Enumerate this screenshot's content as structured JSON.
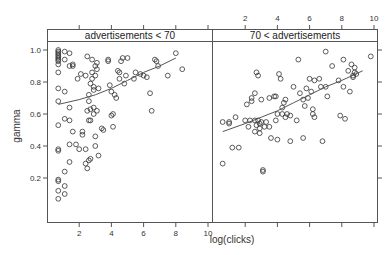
{
  "chart_data": [
    {
      "type": "scatter",
      "panel": "left",
      "strip_label": "advertisements < 70",
      "xlabel": "log(clicks)",
      "ylabel": "gamma",
      "xlim": [
        0,
        10
      ],
      "ylim": [
        0,
        1.05
      ],
      "x_ticks": [
        2,
        4,
        6,
        8,
        10
      ],
      "y_ticks": [
        0.2,
        0.4,
        0.6,
        0.8,
        1.0
      ],
      "trend_line": [
        [
          0.7,
          0.66
        ],
        [
          2,
          0.69
        ],
        [
          3,
          0.72
        ],
        [
          4,
          0.76
        ],
        [
          5,
          0.81
        ],
        [
          6,
          0.86
        ],
        [
          7,
          0.9
        ],
        [
          8,
          0.95
        ]
      ],
      "points": [
        [
          0.7,
          1.0
        ],
        [
          0.7,
          0.99
        ],
        [
          0.7,
          0.98
        ],
        [
          0.7,
          0.97
        ],
        [
          0.7,
          0.96
        ],
        [
          0.7,
          0.95
        ],
        [
          0.7,
          0.94
        ],
        [
          0.7,
          0.93
        ],
        [
          0.7,
          0.91
        ],
        [
          0.7,
          0.86
        ],
        [
          0.7,
          0.76
        ],
        [
          0.7,
          0.68
        ],
        [
          0.7,
          0.53
        ],
        [
          0.7,
          0.38
        ],
        [
          0.7,
          0.37
        ],
        [
          0.7,
          0.19
        ],
        [
          0.7,
          0.18
        ],
        [
          0.7,
          0.12
        ],
        [
          0.7,
          0.07
        ],
        [
          1.1,
          0.99
        ],
        [
          1.1,
          0.94
        ],
        [
          1.1,
          0.74
        ],
        [
          1.1,
          0.57
        ],
        [
          1.1,
          0.24
        ],
        [
          1.1,
          0.15
        ],
        [
          1.1,
          0.1
        ],
        [
          1.4,
          0.98
        ],
        [
          1.4,
          0.9
        ],
        [
          1.4,
          0.64
        ],
        [
          1.4,
          0.56
        ],
        [
          1.4,
          0.41
        ],
        [
          1.4,
          0.3
        ],
        [
          1.6,
          0.91
        ],
        [
          1.6,
          0.9
        ],
        [
          1.6,
          0.49
        ],
        [
          1.8,
          0.41
        ],
        [
          1.9,
          0.82
        ],
        [
          2.0,
          0.38
        ],
        [
          2.1,
          0.85
        ],
        [
          2.2,
          0.49
        ],
        [
          2.2,
          0.47
        ],
        [
          2.4,
          0.84
        ],
        [
          2.4,
          0.38
        ],
        [
          2.4,
          0.29
        ],
        [
          2.5,
          0.96
        ],
        [
          2.5,
          0.62
        ],
        [
          2.5,
          0.26
        ],
        [
          2.6,
          0.72
        ],
        [
          2.6,
          0.68
        ],
        [
          2.6,
          0.56
        ],
        [
          2.6,
          0.31
        ],
        [
          2.7,
          0.79
        ],
        [
          2.7,
          0.63
        ],
        [
          2.7,
          0.56
        ],
        [
          2.7,
          0.32
        ],
        [
          2.8,
          0.94
        ],
        [
          2.8,
          0.86
        ],
        [
          2.8,
          0.82
        ],
        [
          2.9,
          0.77
        ],
        [
          2.9,
          0.75
        ],
        [
          2.9,
          0.64
        ],
        [
          2.9,
          0.6
        ],
        [
          3.0,
          0.9
        ],
        [
          3.0,
          0.84
        ],
        [
          3.0,
          0.46
        ],
        [
          3.0,
          0.4
        ],
        [
          3.1,
          0.92
        ],
        [
          3.1,
          0.88
        ],
        [
          3.1,
          0.62
        ],
        [
          3.2,
          0.76
        ],
        [
          3.2,
          0.34
        ],
        [
          3.4,
          0.51
        ],
        [
          3.5,
          0.5
        ],
        [
          3.8,
          0.94
        ],
        [
          3.8,
          0.93
        ],
        [
          3.9,
          0.78
        ],
        [
          4.0,
          0.74
        ],
        [
          4.0,
          0.59
        ],
        [
          4.1,
          0.6
        ],
        [
          4.1,
          0.52
        ],
        [
          4.2,
          0.72
        ],
        [
          4.3,
          0.7
        ],
        [
          4.4,
          0.87
        ],
        [
          4.5,
          0.86
        ],
        [
          4.5,
          0.82
        ],
        [
          4.6,
          0.93
        ],
        [
          4.7,
          0.95
        ],
        [
          4.8,
          0.79
        ],
        [
          4.9,
          0.84
        ],
        [
          5.0,
          0.95
        ],
        [
          5.4,
          0.82
        ],
        [
          5.5,
          0.86
        ],
        [
          5.8,
          0.85
        ],
        [
          6.0,
          0.84
        ],
        [
          6.2,
          0.83
        ],
        [
          6.4,
          0.73
        ],
        [
          6.5,
          0.62
        ],
        [
          6.7,
          0.94
        ],
        [
          6.8,
          0.93
        ],
        [
          6.9,
          0.9
        ],
        [
          7.5,
          0.84
        ],
        [
          8.0,
          0.98
        ],
        [
          8.4,
          0.88
        ]
      ]
    },
    {
      "type": "scatter",
      "panel": "right",
      "strip_label": "70 < advertisements",
      "xlabel": "log(clicks)",
      "ylabel": "gamma",
      "xlim": [
        0,
        10
      ],
      "ylim": [
        0,
        1.05
      ],
      "x_ticks": [
        2,
        4,
        6,
        8,
        10
      ],
      "y_ticks": [
        0.2,
        0.4,
        0.6,
        0.8,
        1.0
      ],
      "trend_line": [
        [
          0.6,
          0.49
        ],
        [
          2,
          0.54
        ],
        [
          3,
          0.58
        ],
        [
          4,
          0.62
        ],
        [
          5,
          0.67
        ],
        [
          6,
          0.72
        ],
        [
          7,
          0.77
        ],
        [
          8,
          0.81
        ],
        [
          9.3,
          0.87
        ]
      ],
      "points": [
        [
          0.6,
          0.55
        ],
        [
          0.6,
          0.29
        ],
        [
          1.0,
          0.55
        ],
        [
          1.0,
          0.54
        ],
        [
          1.2,
          0.39
        ],
        [
          1.4,
          0.58
        ],
        [
          1.6,
          0.39
        ],
        [
          2.0,
          0.56
        ],
        [
          2.1,
          0.66
        ],
        [
          2.2,
          0.52
        ],
        [
          2.3,
          0.56
        ],
        [
          2.4,
          0.7
        ],
        [
          2.4,
          0.68
        ],
        [
          2.6,
          0.73
        ],
        [
          2.6,
          0.56
        ],
        [
          2.6,
          0.49
        ],
        [
          2.7,
          0.53
        ],
        [
          2.7,
          0.86
        ],
        [
          2.8,
          0.84
        ],
        [
          2.8,
          0.56
        ],
        [
          2.9,
          0.54
        ],
        [
          2.9,
          0.51
        ],
        [
          2.9,
          0.48
        ],
        [
          3.0,
          0.69
        ],
        [
          3.0,
          0.55
        ],
        [
          3.1,
          0.24
        ],
        [
          3.1,
          0.25
        ],
        [
          3.2,
          0.52
        ],
        [
          3.3,
          0.55
        ],
        [
          3.5,
          0.7
        ],
        [
          3.5,
          0.52
        ],
        [
          3.6,
          0.45
        ],
        [
          3.8,
          0.71
        ],
        [
          3.9,
          0.56
        ],
        [
          3.9,
          0.71
        ],
        [
          4.0,
          0.6
        ],
        [
          4.0,
          0.44
        ],
        [
          4.1,
          0.85
        ],
        [
          4.2,
          0.82
        ],
        [
          4.3,
          0.64
        ],
        [
          4.3,
          0.6
        ],
        [
          4.4,
          0.67
        ],
        [
          4.5,
          0.69
        ],
        [
          4.5,
          0.58
        ],
        [
          4.6,
          0.6
        ],
        [
          4.8,
          0.59
        ],
        [
          4.8,
          0.43
        ],
        [
          5.0,
          0.77
        ],
        [
          5.2,
          0.56
        ],
        [
          5.3,
          0.94
        ],
        [
          5.4,
          0.73
        ],
        [
          5.6,
          0.69
        ],
        [
          5.6,
          0.45
        ],
        [
          5.7,
          0.65
        ],
        [
          5.8,
          0.76
        ],
        [
          5.9,
          0.7
        ],
        [
          6.0,
          0.82
        ],
        [
          6.1,
          0.74
        ],
        [
          6.2,
          0.63
        ],
        [
          6.2,
          0.6
        ],
        [
          6.3,
          0.81
        ],
        [
          6.3,
          0.58
        ],
        [
          6.6,
          0.82
        ],
        [
          6.7,
          0.77
        ],
        [
          6.8,
          0.43
        ],
        [
          7.0,
          0.99
        ],
        [
          7.0,
          0.77
        ],
        [
          7.1,
          0.71
        ],
        [
          7.4,
          0.9
        ],
        [
          7.8,
          0.81
        ],
        [
          7.9,
          0.59
        ],
        [
          8.1,
          0.94
        ],
        [
          8.1,
          0.77
        ],
        [
          8.2,
          0.57
        ],
        [
          8.4,
          0.87
        ],
        [
          8.5,
          0.74
        ],
        [
          8.6,
          0.91
        ],
        [
          8.7,
          0.84
        ],
        [
          8.7,
          0.83
        ],
        [
          8.8,
          0.89
        ],
        [
          8.8,
          0.86
        ],
        [
          8.9,
          0.85
        ],
        [
          9.8,
          0.96
        ]
      ]
    }
  ],
  "axes": {
    "xlabel": "log(clicks)",
    "ylabel": "gamma",
    "left_x_ticks": [
      "2",
      "4",
      "6",
      "8",
      "10"
    ],
    "top_x_ticks": [
      "2",
      "4",
      "6",
      "8",
      "10"
    ],
    "y_ticks": [
      "0.2",
      "0.4",
      "0.6",
      "0.8",
      "1.0"
    ]
  },
  "panels": {
    "left_strip": "advertisements < 70",
    "right_strip": "70 < advertisements"
  },
  "colors": {
    "strip_bg": "#ffffff",
    "border": "#555555",
    "point": "#333333",
    "line": "#555555"
  }
}
